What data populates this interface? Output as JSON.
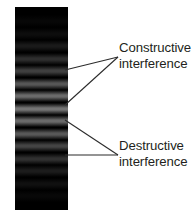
{
  "figure": {
    "background_color": "#ffffff",
    "width": 194,
    "height": 216
  },
  "fringe_panel": {
    "name": "interference-fringe-pattern",
    "background_color": "#000000",
    "x": 15,
    "y": 7,
    "width": 53,
    "height": 203,
    "band_spacing_px": 12.6,
    "bands": [
      {
        "center_y": 14,
        "peak_gray": "#070707",
        "type": "constructive"
      },
      {
        "center_y": 27,
        "peak_gray": "#0d0d0d",
        "type": "constructive"
      },
      {
        "center_y": 39,
        "peak_gray": "#1a1a1a",
        "type": "constructive"
      },
      {
        "center_y": 52,
        "peak_gray": "#2e2e2e",
        "type": "constructive"
      },
      {
        "center_y": 64,
        "peak_gray": "#3f3f3f",
        "type": "constructive"
      },
      {
        "center_y": 77,
        "peak_gray": "#565656",
        "type": "constructive"
      },
      {
        "center_y": 89,
        "peak_gray": "#6a6a6a",
        "type": "constructive"
      },
      {
        "center_y": 102,
        "peak_gray": "#747474",
        "type": "constructive"
      },
      {
        "center_y": 114,
        "peak_gray": "#6a6a6a",
        "type": "constructive"
      },
      {
        "center_y": 127,
        "peak_gray": "#585858",
        "type": "constructive"
      },
      {
        "center_y": 139,
        "peak_gray": "#444444",
        "type": "constructive"
      },
      {
        "center_y": 152,
        "peak_gray": "#303030",
        "type": "constructive"
      },
      {
        "center_y": 164,
        "peak_gray": "#1c1c1c",
        "type": "constructive"
      },
      {
        "center_y": 177,
        "peak_gray": "#101010",
        "type": "constructive"
      },
      {
        "center_y": 189,
        "peak_gray": "#080808",
        "type": "constructive"
      }
    ]
  },
  "annotations": {
    "constructive": {
      "line1": "Constructive",
      "line2": "interference",
      "text_color": "#231f20",
      "text_x": 119,
      "text_y": 40,
      "leader_apex": {
        "x": 118,
        "y": 57
      },
      "leader_targets": [
        {
          "x": 65,
          "y": 70
        },
        {
          "x": 65,
          "y": 105
        }
      ]
    },
    "destructive": {
      "line1": "Destructive",
      "line2": "interference",
      "text_color": "#231f20",
      "text_x": 119,
      "text_y": 138,
      "leader_apex": {
        "x": 118,
        "y": 155
      },
      "leader_targets": [
        {
          "x": 65,
          "y": 120
        },
        {
          "x": 65,
          "y": 155
        }
      ]
    }
  },
  "leader_style": {
    "stroke_color": "#2b2b2b",
    "stroke_width": 1.1
  }
}
